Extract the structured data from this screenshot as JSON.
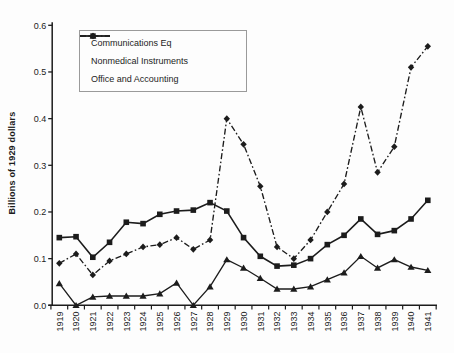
{
  "figure": {
    "background": "#fdfdfd",
    "ink_color": "#1c1c1c"
  },
  "chart_data": {
    "type": "line",
    "title": "",
    "xlabel": "",
    "ylabel": "Billions of 1929 dollars",
    "ylim": [
      0,
      0.6
    ],
    "ytick_labels": [
      "0.0",
      "0.1",
      "0.2",
      "0.3",
      "0.4",
      "0.5",
      "0.6"
    ],
    "grid": false,
    "legend_position": "inside-top-left",
    "categories": [
      "1919",
      "1920",
      "1921",
      "1922",
      "1923",
      "1924",
      "1925",
      "1926",
      "1927",
      "1928",
      "1929",
      "1930",
      "1931",
      "1932",
      "1933",
      "1934",
      "1935",
      "1936",
      "1937",
      "1938",
      "1939",
      "1940",
      "1941"
    ],
    "series": [
      {
        "name": "Communications Eq",
        "marker": "diamond",
        "line_style": "dash-dot",
        "color": "#1c1c1c",
        "values": [
          0.09,
          0.11,
          0.065,
          0.095,
          0.11,
          0.125,
          0.13,
          0.145,
          0.12,
          0.14,
          0.4,
          0.345,
          0.255,
          0.125,
          0.1,
          0.14,
          0.2,
          0.26,
          0.425,
          0.285,
          0.34,
          0.51,
          0.555
        ]
      },
      {
        "name": "Nonmedical Instruments",
        "marker": "triangle",
        "line_style": "solid",
        "color": "#1c1c1c",
        "values": [
          0.047,
          0.0,
          0.018,
          0.02,
          0.02,
          0.02,
          0.025,
          0.048,
          0.0,
          0.04,
          0.098,
          0.08,
          0.058,
          0.035,
          0.035,
          0.04,
          0.055,
          0.07,
          0.105,
          0.08,
          0.098,
          0.082,
          0.075
        ]
      },
      {
        "name": "Office and Accounting",
        "marker": "square",
        "line_style": "solid",
        "color": "#1c1c1c",
        "values": [
          0.145,
          0.147,
          0.103,
          0.135,
          0.178,
          0.175,
          0.195,
          0.202,
          0.204,
          0.22,
          0.202,
          0.145,
          0.105,
          0.084,
          0.086,
          0.1,
          0.13,
          0.15,
          0.185,
          0.152,
          0.16,
          0.185,
          0.225
        ]
      }
    ]
  }
}
